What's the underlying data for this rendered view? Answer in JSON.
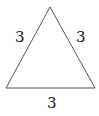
{
  "diagram": {
    "shape": "equilateral-triangle",
    "sides": {
      "left": "3",
      "right": "3",
      "bottom": "3"
    },
    "stroke_color": "#555555",
    "label_color": "#222222"
  }
}
